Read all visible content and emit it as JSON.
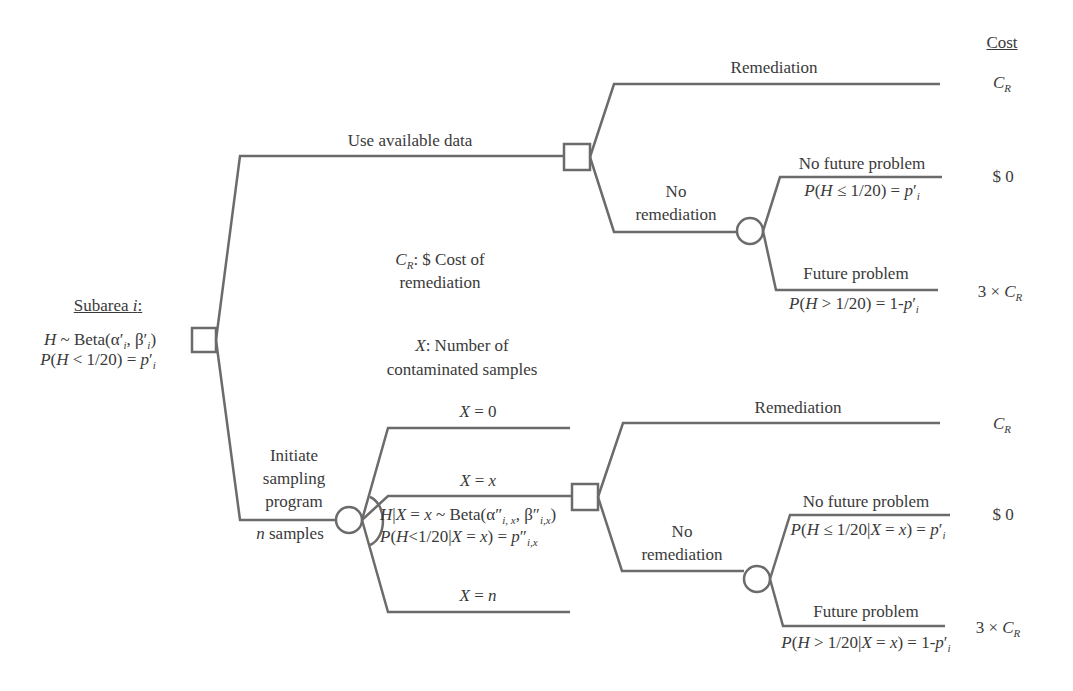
{
  "colors": {
    "line": "#6b6b6b",
    "text": "#3a3a3a",
    "background": "#ffffff"
  },
  "header": {
    "cost_title": "Cost"
  },
  "root": {
    "title": "Subarea i:",
    "prior": "H ~ Beta(α′ᵢ, β′ᵢ)",
    "prob": "P(H < 1/20) = p′ᵢ",
    "node_type": "decision"
  },
  "legend": {
    "cr_def_line1": "C_R: $ Cost of",
    "cr_def_line2": "remediation",
    "x_def_line1": "X: Number of",
    "x_def_line2": "contaminated samples"
  },
  "branch_available": {
    "label": "Use available data",
    "node_type": "decision",
    "remediation": {
      "label": "Remediation",
      "cost": "C_R"
    },
    "no_remediation": {
      "label_line1": "No",
      "label_line2": "remediation",
      "node_type": "chance",
      "no_future_problem": {
        "label": "No future problem",
        "prob": "P(H ≤ 1/20) = p′ᵢ",
        "cost": "$ 0"
      },
      "future_problem": {
        "label": "Future problem",
        "prob": "P(H > 1/20) = 1-p′ᵢ",
        "cost": "3 × C_R"
      }
    }
  },
  "branch_sampling": {
    "label_line1": "Initiate",
    "label_line2": "sampling",
    "label_line3": "program",
    "label_line4": "n samples",
    "node_type": "chance",
    "outcomes": [
      "X = 0",
      "X = x",
      "X = n"
    ],
    "posterior": "H|X = x ~ Beta(α″ᵢ,ₓ, β″ᵢ,ₓ)",
    "posterior_prob": "P(H<1/20|X = x) = p″ᵢ,ₓ",
    "decision": {
      "node_type": "decision",
      "remediation": {
        "label": "Remediation",
        "cost": "C_R"
      },
      "no_remediation": {
        "label_line1": "No",
        "label_line2": "remediation",
        "node_type": "chance",
        "no_future_problem": {
          "label": "No future problem",
          "prob": "P(H ≤ 1/20|X = x) = p′ᵢ",
          "cost": "$ 0"
        },
        "future_problem": {
          "label": "Future problem",
          "prob": "P(H > 1/20|X = x) = 1-p′ᵢ",
          "cost": "3 × C_R"
        }
      }
    }
  }
}
